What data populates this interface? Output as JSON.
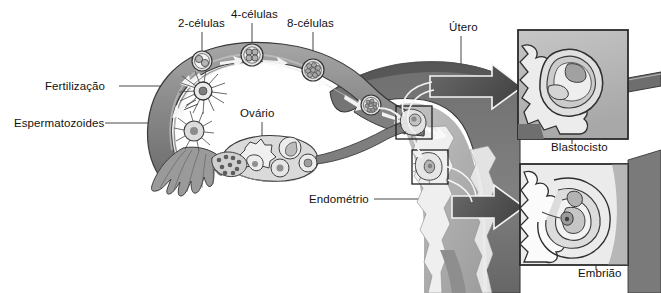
{
  "figure": {
    "language": "pt-BR",
    "style": "grayscale medical illustration",
    "labels": {
      "fertilizacao": "Fertilização",
      "espermatozoides": "Espermatozoides",
      "duas_celulas": "2-células",
      "quatro_celulas": "4-células",
      "oito_celulas": "8-células",
      "ovario": "Ovário",
      "utero": "Útero",
      "endometrio": "Endométrio",
      "blastocisto": "Blastocisto",
      "embriao": "Embrião"
    },
    "colors": {
      "background": "#ffffff",
      "text": "#111111",
      "leader_line": "#3a3a3a",
      "tube_outer": "#8d8d8d",
      "tube_outline": "#3f3f3f",
      "tube_lumen": "#c9c9c9",
      "uterus_wall": "#767676",
      "uterus_wall_dark": "#5e5e5e",
      "uterus_interior": "#adadad",
      "endometrium_light": "#efefef",
      "ovary_fill": "#d9d9d9",
      "inset_fill": "#b9b9b9",
      "inset_border": "#2e2e2e",
      "arrow_white": "#fdfdfd",
      "arrow_dark": "#5a5a5a",
      "embryo_light": "#ededed"
    },
    "insets": [
      {
        "name": "blastocisto",
        "caption": "Blastocisto",
        "x": 518,
        "y": 30,
        "w": 110,
        "h": 109
      },
      {
        "name": "embriao",
        "caption": "Embrião",
        "x": 520,
        "y": 164,
        "w": 108,
        "h": 101
      }
    ],
    "stages": [
      {
        "name": "fertilizacao",
        "label": "Fertilização",
        "order": 1
      },
      {
        "name": "2-celulas",
        "label": "2-células",
        "order": 2
      },
      {
        "name": "4-celulas",
        "label": "4-células",
        "order": 3
      },
      {
        "name": "8-celulas",
        "label": "8-células",
        "order": 4
      },
      {
        "name": "blastocisto",
        "label": "Blastocisto",
        "order": 5
      },
      {
        "name": "embriao",
        "label": "Embrião",
        "order": 6
      }
    ]
  }
}
